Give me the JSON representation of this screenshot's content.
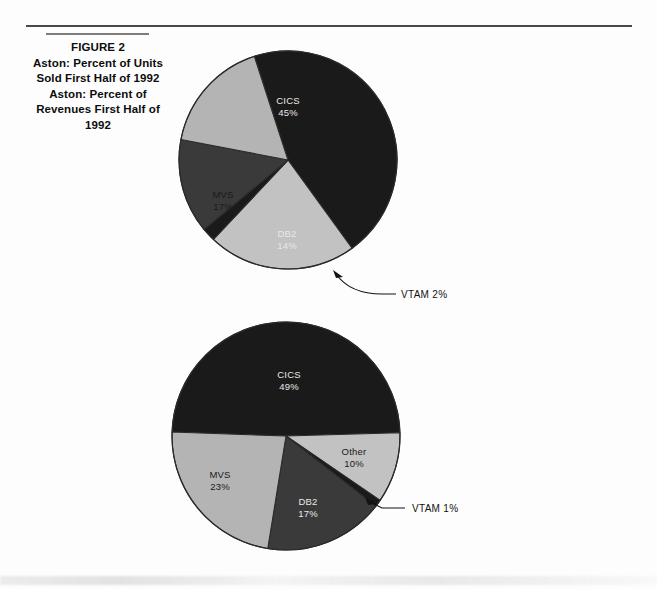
{
  "figure": {
    "title": "FIGURE 2",
    "subtitle_lines": [
      "Aston: Percent of Units",
      "Sold First Half of 1992",
      "Aston: Percent of",
      "Revenues First Half of",
      "1992"
    ]
  },
  "colors": {
    "cics": "#1a1a1a",
    "mvs": "#b4b4b4",
    "db2": "#3a3a3a",
    "other": "#c2c2c2",
    "vtam": "#1a1a1a",
    "outline": "#2b2b2b",
    "page_background": "#fdfdfd",
    "rule": "#4a4a4a"
  },
  "chart_data": [
    {
      "type": "pie",
      "title": "Aston: Percent of Units Sold First Half of 1992",
      "labels": [
        "CICS",
        "Other",
        "VTAM",
        "DB2",
        "MVS"
      ],
      "values": [
        45,
        22,
        2,
        14,
        17
      ],
      "value_labels": [
        "45%",
        "22%",
        "2%",
        "14%",
        "17%"
      ],
      "legend": "none",
      "slice_text": [
        {
          "name": "CICS",
          "line1": "CICS",
          "line2": "45%"
        },
        {
          "name": "Other",
          "line1": "Other",
          "line2": "22%"
        },
        {
          "name": "DB2",
          "line1": "DB2",
          "line2": "14%"
        },
        {
          "name": "MVS",
          "line1": "MVS",
          "line2": "17%"
        }
      ],
      "callout": {
        "name": "VTAM",
        "text": "VTAM  2%"
      }
    },
    {
      "type": "pie",
      "title": "Aston: Percent of Revenues First Half of 1992",
      "labels": [
        "CICS",
        "Other",
        "VTAM",
        "DB2",
        "MVS"
      ],
      "values": [
        49,
        10,
        1,
        17,
        23
      ],
      "value_labels": [
        "49%",
        "10%",
        "1%",
        "17%",
        "23%"
      ],
      "legend": "none",
      "slice_text": [
        {
          "name": "CICS",
          "line1": "CICS",
          "line2": "49%"
        },
        {
          "name": "Other",
          "line1": "Other",
          "line2": "10%"
        },
        {
          "name": "DB2",
          "line1": "DB2",
          "line2": "17%"
        },
        {
          "name": "MVS",
          "line1": "MVS",
          "line2": "23%"
        }
      ],
      "callout": {
        "name": "VTAM",
        "text": "VTAM  1%"
      }
    }
  ]
}
